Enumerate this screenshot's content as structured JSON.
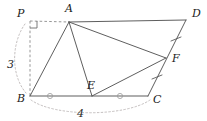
{
  "figure": {
    "stroke_color": "#555555",
    "dashed_color": "#8a8a8a",
    "dotted_color": "#b0a9a9",
    "label_color": "#1a1a1a",
    "background_color": "#ffffff",
    "points": [
      {
        "id": "P",
        "label": "P",
        "x": 30,
        "y": 21,
        "label_x": 17,
        "label_y": 17,
        "construction": true
      },
      {
        "id": "A",
        "label": "A",
        "x": 69,
        "y": 22,
        "label_x": 65,
        "label_y": 12,
        "construction": false
      },
      {
        "id": "D",
        "label": "D",
        "x": 186,
        "y": 20,
        "label_x": 192,
        "label_y": 17,
        "construction": false
      },
      {
        "id": "F",
        "label": "F",
        "x": 166,
        "y": 58,
        "label_x": 172,
        "label_y": 62,
        "construction": false
      },
      {
        "id": "B",
        "label": "B",
        "x": 30,
        "y": 96,
        "label_x": 17,
        "label_y": 102,
        "construction": false
      },
      {
        "id": "E",
        "label": "E",
        "x": 92,
        "y": 96,
        "label_x": 87,
        "label_y": 89,
        "construction": false
      },
      {
        "id": "C",
        "label": "C",
        "x": 148,
        "y": 96,
        "label_x": 153,
        "label_y": 103,
        "construction": false
      }
    ],
    "segments": [
      {
        "id": "AD",
        "from": "A",
        "to": "D",
        "style": "solid"
      },
      {
        "id": "AB",
        "from": "A",
        "to": "B",
        "style": "solid"
      },
      {
        "id": "AE",
        "from": "A",
        "to": "E",
        "style": "solid"
      },
      {
        "id": "AF",
        "from": "A",
        "to": "F",
        "style": "solid"
      },
      {
        "id": "DC",
        "from": "D",
        "to": "C",
        "style": "solid"
      },
      {
        "id": "EF",
        "from": "E",
        "to": "F",
        "style": "solid"
      },
      {
        "id": "BC",
        "from": "B",
        "to": "C",
        "style": "solid"
      },
      {
        "id": "PA",
        "from": "P",
        "to": "A",
        "style": "dashed"
      },
      {
        "id": "PB",
        "from": "P",
        "to": "B",
        "style": "dashed"
      }
    ],
    "right_angle": {
      "at": "P",
      "size": 7
    },
    "tick_marks": [
      {
        "id": "tick-DF",
        "on": "DF",
        "x": 176,
        "y": 39
      },
      {
        "id": "tick-FC",
        "on": "FC",
        "x": 157,
        "y": 77
      }
    ],
    "angle_markers": [
      {
        "id": "marker-BE",
        "on": "BE",
        "x": 50,
        "y": 96,
        "r": 2.6
      },
      {
        "id": "marker-EC",
        "on": "EC",
        "x": 120,
        "y": 96,
        "r": 2.6
      }
    ],
    "measures": [
      {
        "id": "measure-3",
        "value": "3",
        "x": 10,
        "y": 64,
        "describes": "PB"
      },
      {
        "id": "measure-4",
        "value": "4",
        "x": 80,
        "y": 114,
        "describes": "BC"
      }
    ],
    "arcs": [
      {
        "id": "arc-left",
        "label": "3",
        "d": "M 25 24 C 12 42 10 74 26 93"
      },
      {
        "id": "arc-bottom",
        "label": "4",
        "d": "M 31 100 C 55 117 125 117 150 100"
      }
    ]
  }
}
